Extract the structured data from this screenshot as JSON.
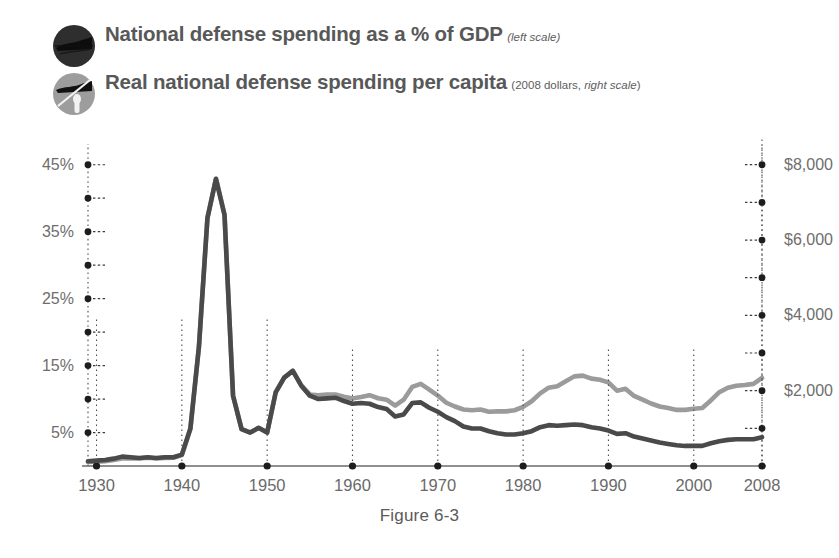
{
  "caption": "Figure 6-3",
  "legend": [
    {
      "icon": "dark-circle-marker-icon",
      "title": "National defense spending as a % of GDP",
      "subtitle_plain": "",
      "subtitle_italic": "(left scale)",
      "color": "#3f3f3f"
    },
    {
      "icon": "gray-circle-marker-icon",
      "title": "Real national defense spending per capita",
      "subtitle_plain": "(2008 dollars, ",
      "subtitle_italic": "right scale",
      "subtitle_tail": ")",
      "color": "#9b9b9b"
    }
  ],
  "chart_data": {
    "type": "line",
    "xlabel": "",
    "ylabel": "National defense spending as a % of GDP",
    "y2label": "Real national defense spending per capita (2008 dollars)",
    "grid": "vertical dotted at decade ticks",
    "legend_position": "top-left",
    "xlim": [
      1929,
      2008
    ],
    "ylim": [
      0,
      47.5
    ],
    "y2lim": [
      0,
      8444
    ],
    "xticks": [
      1930,
      1940,
      1950,
      1960,
      1970,
      1980,
      1990,
      2000,
      2008
    ],
    "xticklabels": [
      "1930",
      "1940",
      "1950",
      "1960",
      "1970",
      "1980",
      "1990",
      "2000",
      "2008"
    ],
    "yticks_major": [
      5,
      15,
      25,
      35,
      45
    ],
    "yticklabels_major": [
      "5%",
      "15%",
      "25%",
      "35%",
      "45%"
    ],
    "yticks_minor": [
      0,
      10,
      20,
      30,
      40
    ],
    "y2ticks_major": [
      2000,
      4000,
      6000,
      8000
    ],
    "y2ticklabels_major": [
      "$2,000",
      "$4,000",
      "$6,000",
      "$8,000"
    ],
    "y2ticks_minor": [
      1000,
      3000,
      5000,
      7000
    ],
    "series": [
      {
        "name": "National defense spending as a % of GDP",
        "axis": "left",
        "color": "#4a4a4a",
        "units": "percent",
        "x": [
          1929,
          1930,
          1931,
          1932,
          1933,
          1934,
          1935,
          1936,
          1937,
          1938,
          1939,
          1940,
          1941,
          1942,
          1943,
          1944,
          1945,
          1946,
          1947,
          1948,
          1949,
          1950,
          1951,
          1952,
          1953,
          1954,
          1955,
          1956,
          1957,
          1958,
          1959,
          1960,
          1961,
          1962,
          1963,
          1964,
          1965,
          1966,
          1967,
          1968,
          1969,
          1970,
          1971,
          1972,
          1973,
          1974,
          1975,
          1976,
          1977,
          1978,
          1979,
          1980,
          1981,
          1982,
          1983,
          1984,
          1985,
          1986,
          1987,
          1988,
          1989,
          1990,
          1991,
          1992,
          1993,
          1994,
          1995,
          1996,
          1997,
          1998,
          1999,
          2000,
          2001,
          2002,
          2003,
          2004,
          2005,
          2006,
          2007,
          2008
        ],
        "values": [
          0.7,
          0.8,
          0.9,
          1.1,
          1.4,
          1.3,
          1.2,
          1.3,
          1.2,
          1.3,
          1.3,
          1.7,
          5.6,
          17.8,
          37.0,
          42.9,
          37.5,
          10.5,
          5.5,
          5.0,
          5.7,
          5.0,
          11.0,
          13.2,
          14.2,
          12.0,
          10.5,
          10.0,
          10.1,
          10.2,
          9.7,
          9.3,
          9.4,
          9.3,
          8.8,
          8.5,
          7.4,
          7.7,
          9.4,
          9.5,
          8.7,
          8.1,
          7.3,
          6.7,
          5.9,
          5.6,
          5.6,
          5.2,
          4.9,
          4.7,
          4.7,
          4.9,
          5.2,
          5.8,
          6.1,
          6.0,
          6.1,
          6.2,
          6.1,
          5.8,
          5.6,
          5.3,
          4.8,
          4.9,
          4.4,
          4.1,
          3.8,
          3.5,
          3.3,
          3.1,
          3.0,
          3.0,
          3.0,
          3.4,
          3.7,
          3.9,
          4.0,
          4.0,
          4.0,
          4.3
        ]
      },
      {
        "name": "Real national defense spending per capita",
        "axis": "right",
        "color": "#9b9b9b",
        "units": "2008 dollars",
        "x": [
          1929,
          1930,
          1931,
          1932,
          1933,
          1934,
          1935,
          1936,
          1937,
          1938,
          1939,
          1940,
          1941,
          1942,
          1943,
          1944,
          1945,
          1946,
          1947,
          1948,
          1949,
          1950,
          1951,
          1952,
          1953,
          1954,
          1955,
          1956,
          1957,
          1958,
          1959,
          1960,
          1961,
          1962,
          1963,
          1964,
          1965,
          1966,
          1967,
          1968,
          1969,
          1970,
          1971,
          1972,
          1973,
          1974,
          1975,
          1976,
          1977,
          1978,
          1979,
          1980,
          1981,
          1982,
          1983,
          1984,
          1985,
          1986,
          1987,
          1988,
          1989,
          1990,
          1991,
          1992,
          1993,
          1994,
          1995,
          1996,
          1997,
          1998,
          1999,
          2000,
          2001,
          2002,
          2003,
          2004,
          2005,
          2006,
          2007,
          2008
        ],
        "values": [
          110,
          115,
          130,
          160,
          200,
          210,
          200,
          220,
          200,
          215,
          220,
          290,
          980,
          3150,
          6600,
          7620,
          6680,
          1870,
          980,
          890,
          1010,
          890,
          1960,
          2350,
          2530,
          2140,
          1900,
          1880,
          1900,
          1900,
          1840,
          1790,
          1830,
          1880,
          1800,
          1760,
          1600,
          1760,
          2100,
          2180,
          2030,
          1870,
          1680,
          1580,
          1500,
          1480,
          1500,
          1440,
          1450,
          1450,
          1480,
          1570,
          1720,
          1930,
          2080,
          2120,
          2250,
          2380,
          2400,
          2320,
          2290,
          2220,
          2000,
          2050,
          1860,
          1760,
          1660,
          1580,
          1540,
          1490,
          1490,
          1520,
          1540,
          1740,
          1960,
          2080,
          2130,
          2150,
          2180,
          2340
        ]
      }
    ],
    "annotations": [
      {
        "label": "World War II peak",
        "x": 1944,
        "left_value": 42.9,
        "right_value": 7620
      },
      {
        "label": "Korean War peak",
        "x": 1953,
        "left_value": 14.2,
        "right_value": 2530
      },
      {
        "label": "Vietnam War peak",
        "x": 1968,
        "left_value": 9.5,
        "right_value": 2180
      },
      {
        "label": "Reagan buildup peak",
        "x": 1986,
        "left_value": 6.2,
        "right_value": 2380
      }
    ]
  }
}
